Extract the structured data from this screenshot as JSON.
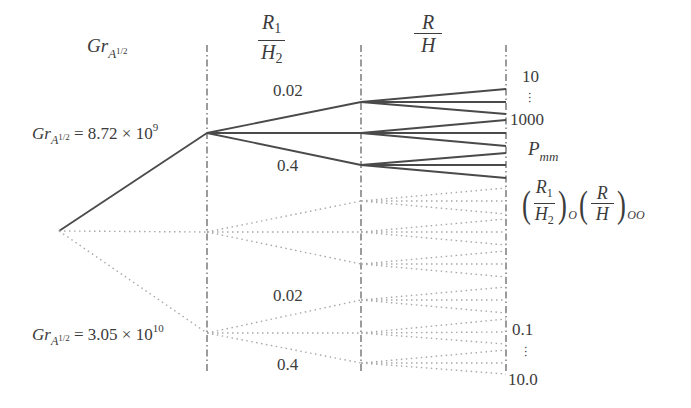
{
  "header": {
    "col1_label": {
      "base": "Gr",
      "sub": "A",
      "sup": "1/2"
    },
    "col2_label": {
      "numerator": "R",
      "numerator_sub": "1",
      "denominator": "H",
      "denominator_sub": "2"
    },
    "col3_label": {
      "numerator": "R",
      "denominator": "H"
    }
  },
  "root_labels": {
    "upper": {
      "base": "Gr",
      "sub": "A",
      "sup": "1/2",
      "equals": "= 8.72 × 10",
      "exponent": "9"
    },
    "lower": {
      "base": "Gr",
      "sub": "A",
      "sup": "1/2",
      "equals": "= 3.05 × 10",
      "exponent": "10"
    }
  },
  "branch_labels": {
    "upper_ratio_high": "0.02",
    "upper_ratio_low": "0.4",
    "lower_ratio_high": "0.02",
    "lower_ratio_low": "0.4"
  },
  "right_labels": {
    "top_start": "10",
    "top_vdots": "⋮",
    "top_end": "1000",
    "pmm": {
      "base": "P",
      "sub": "mm"
    },
    "optimal": {
      "frac1_num": "R",
      "frac1_num_sub": "1",
      "frac1_den": "H",
      "frac1_den_sub": "2",
      "frac1_sub": "O",
      "frac2_num": "R",
      "frac2_den": "H",
      "frac2_sub": "OO"
    },
    "bottom_start": "0.1",
    "bottom_vdots": "⋮",
    "bottom_end": "10.0"
  },
  "style": {
    "solid_color": "#4a4a4a",
    "dotted_color": "#a8a8a8",
    "guide_color": "#5a5a5a"
  },
  "tree": {
    "root": [
      59,
      231
    ],
    "guides_x": [
      207,
      361,
      506
    ],
    "guide_y_range": [
      45,
      372
    ],
    "level1": [
      {
        "node": [
          207,
          133
        ],
        "style": "solid"
      },
      {
        "node": [
          207,
          232
        ],
        "style": "dotted"
      },
      {
        "node": [
          207,
          333
        ],
        "style": "dotted"
      }
    ],
    "level2": [
      {
        "from": [
          207,
          133
        ],
        "to": [
          [
            361,
            102
          ],
          [
            361,
            133
          ],
          [
            361,
            165
          ]
        ],
        "style": "solid"
      },
      {
        "from": [
          207,
          232
        ],
        "to": [
          [
            361,
            201
          ],
          [
            361,
            232
          ],
          [
            361,
            264
          ]
        ],
        "style": "dotted"
      },
      {
        "from": [
          207,
          333
        ],
        "to": [
          [
            361,
            300
          ],
          [
            361,
            333
          ],
          [
            361,
            363
          ]
        ],
        "style": "dotted"
      }
    ],
    "level3": [
      {
        "from": [
          361,
          102
        ],
        "to_y": [
          89,
          102,
          114
        ],
        "style": "solid"
      },
      {
        "from": [
          361,
          133
        ],
        "to_y": [
          120,
          133,
          146
        ],
        "style": "solid"
      },
      {
        "from": [
          361,
          165
        ],
        "to_y": [
          153,
          165,
          178
        ],
        "style": "solid"
      },
      {
        "from": [
          361,
          201
        ],
        "to_y": [
          188,
          201,
          214
        ],
        "style": "dotted"
      },
      {
        "from": [
          361,
          232
        ],
        "to_y": [
          219,
          232,
          245
        ],
        "style": "dotted"
      },
      {
        "from": [
          361,
          264
        ],
        "to_y": [
          251,
          264,
          277
        ],
        "style": "dotted"
      },
      {
        "from": [
          361,
          300
        ],
        "to_y": [
          287,
          300,
          313
        ],
        "style": "dotted"
      },
      {
        "from": [
          361,
          333
        ],
        "to_y": [
          319,
          332,
          344
        ],
        "style": "dotted"
      },
      {
        "from": [
          361,
          363
        ],
        "to_y": [
          350,
          363,
          374
        ],
        "style": "dotted"
      }
    ]
  }
}
